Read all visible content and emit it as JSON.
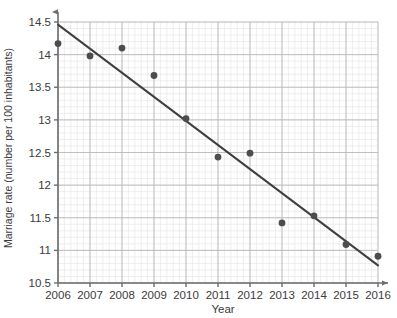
{
  "chart_data": {
    "type": "scatter",
    "title": "",
    "xlabel": "Year",
    "ylabel": "Marriage rate (number per 100 inhabitants)",
    "x": [
      2006,
      2007,
      2008,
      2009,
      2010,
      2011,
      2012,
      2013,
      2014,
      2015,
      2016
    ],
    "values": [
      14.17,
      13.98,
      14.1,
      13.68,
      13.02,
      12.43,
      12.49,
      11.42,
      11.53,
      11.09,
      10.91
    ],
    "series": [
      {
        "name": "Marriage rate",
        "values": [
          14.17,
          13.98,
          14.1,
          13.68,
          13.02,
          12.43,
          12.49,
          11.42,
          11.53,
          11.09,
          10.91
        ],
        "marker": "circle",
        "color": "#4d4d4d"
      },
      {
        "name": "Trend line",
        "type": "line",
        "color": "#3f3f3f",
        "endpoints": [
          {
            "x": 2006,
            "y": 14.46
          },
          {
            "x": 2016,
            "y": 10.77
          }
        ]
      }
    ],
    "xlim": [
      2006,
      2016
    ],
    "ylim": [
      10.5,
      14.5
    ],
    "xticks": [
      "2006",
      "2007",
      "2008",
      "2009",
      "2010",
      "2011",
      "2012",
      "2013",
      "2014",
      "2015",
      "2016"
    ],
    "yticks": [
      "10.5",
      "11",
      "11.5",
      "12",
      "12.5",
      "13",
      "13.5",
      "14",
      "14.5"
    ],
    "ytick_values": [
      10.5,
      11,
      11.5,
      12,
      12.5,
      13,
      13.5,
      14,
      14.5
    ],
    "grid": true,
    "minor_grid": true,
    "legend": "none",
    "axis_arrows": true
  },
  "colors": {
    "marker": "#4d4d4d",
    "trend_line": "#3f3f3f",
    "axis": "#6e6e6e",
    "major_grid": "#b9b9b9",
    "minor_grid": "#e2e2e2",
    "text": "#3b3b3b",
    "background": "#ffffff"
  }
}
